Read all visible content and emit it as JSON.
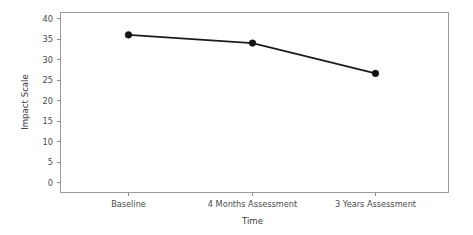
{
  "chart_data": {
    "type": "line",
    "title": "",
    "subtitle": "",
    "xlabel": "Time",
    "ylabel": "Impact Scale",
    "categories": [
      "Baseline",
      "4 Months Assessment",
      "3 Years Assessment"
    ],
    "values": [
      36,
      34,
      26.6
    ],
    "series": [
      {
        "name": "Impact Scale",
        "values": [
          36,
          34,
          26.6
        ]
      }
    ],
    "ylim": [
      0,
      40
    ],
    "yticks": [
      0,
      5,
      10,
      15,
      20,
      25,
      30,
      35,
      40
    ],
    "ytick_labels": [
      "0",
      "5",
      "10",
      "15",
      "20",
      "25",
      "30",
      "35",
      "40"
    ],
    "xtick_labels": [
      "Baseline",
      "4 Months Assessment",
      "3 Years Assessment"
    ],
    "grid": false,
    "legend": false,
    "legend_position": "none",
    "marker": "filled-circle",
    "line_color": "#1c1c1c",
    "marker_color": "#141414",
    "frame_color": "#9b9b9b",
    "background_color": "#ffffff",
    "annotations": []
  },
  "axes": {
    "y_title": "Impact Scale",
    "x_title": "Time",
    "y_ticks": [
      "40",
      "35",
      "30",
      "25",
      "20",
      "15",
      "10",
      "5",
      "0"
    ]
  },
  "points": [
    {
      "label": "Baseline",
      "value": "36"
    },
    {
      "label": "4 Months Assessment",
      "value": "34"
    },
    {
      "label": "3 Years Assessment",
      "value": "26.6"
    }
  ]
}
